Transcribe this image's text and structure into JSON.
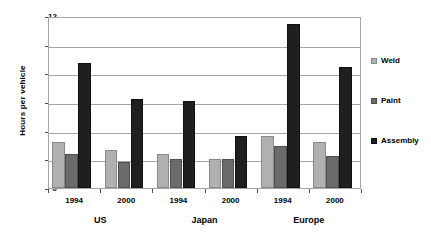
{
  "chart_data": {
    "type": "bar",
    "title": "",
    "xlabel": "",
    "ylabel": "Hours per vehicle",
    "ylim": [
      0,
      12
    ],
    "ytick_step": 2,
    "yticks": [
      "0",
      "2",
      "4",
      "6",
      "8",
      "10",
      "12"
    ],
    "grid": true,
    "legend_position": "right",
    "categories": [
      "1994",
      "2000",
      "1994",
      "2000",
      "1994",
      "2000"
    ],
    "groups": [
      {
        "name": "US",
        "years": [
          "1994",
          "2000"
        ]
      },
      {
        "name": "Japan",
        "years": [
          "1994",
          "2000"
        ]
      },
      {
        "name": "Europe",
        "years": [
          "1994",
          "2000"
        ]
      }
    ],
    "series": [
      {
        "name": "Weld",
        "color": "#b0b0b0",
        "values": [
          3.2,
          2.65,
          2.4,
          2.0,
          3.6,
          3.2
        ]
      },
      {
        "name": "Paint",
        "color": "#6b6b6b",
        "values": [
          2.4,
          1.8,
          2.05,
          2.0,
          2.95,
          2.25
        ]
      },
      {
        "name": "Assembly",
        "color": "#1f1f1f",
        "values": [
          8.75,
          6.2,
          6.05,
          3.6,
          11.45,
          8.45
        ]
      }
    ]
  },
  "axis": {
    "y_title": "Hours per vehicle",
    "y_ticks": [
      "12",
      "10",
      "8",
      "6",
      "4",
      "2",
      "0"
    ],
    "x_year_labels": [
      "1994",
      "2000",
      "1994",
      "2000",
      "1994",
      "2000"
    ],
    "x_group_labels": [
      "US",
      "Japan",
      "Europe"
    ]
  },
  "legend": {
    "items": [
      {
        "label": "Weld",
        "swatch": "weld-swatch-icon"
      },
      {
        "label": "Paint",
        "swatch": "paint-swatch-icon"
      },
      {
        "label": "Assembly",
        "swatch": "assembly-swatch-icon"
      }
    ]
  }
}
